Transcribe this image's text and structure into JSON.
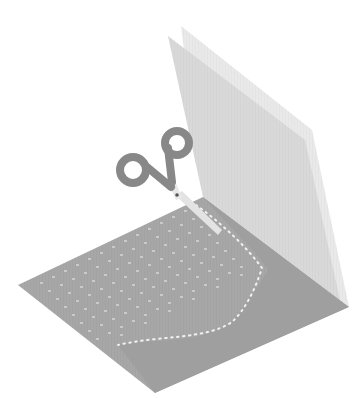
{
  "illustration": {
    "title": "Paper cutting illustration",
    "description": "Folded sheet of paper with a perforated cut pattern and a pair of scissors",
    "colors": {
      "background": "#ffffff",
      "floor_sheet": "#a6a6a6",
      "floor_shadow_region": "#9e9e9e",
      "back_sheet": "#e8e8e8",
      "front_sheet": "#d6d6d6",
      "scissor_handles": "#8a8a8a",
      "scissor_blades": "#e2e2e2",
      "scissor_pivot": "#555555",
      "perforation_dots": "#ececec"
    },
    "icons": {
      "scissors": "scissors-icon"
    }
  }
}
